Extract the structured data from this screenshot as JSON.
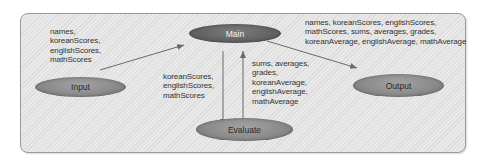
{
  "diagram": {
    "type": "data-flow",
    "nodes": {
      "main": "Main",
      "input": "Input",
      "evaluate": "Evaluate",
      "output": "Output"
    },
    "edges": {
      "input_to_main": {
        "from": "Input",
        "to": "Main",
        "lines": [
          "names,",
          "koreanScores,",
          "englishScores,",
          "mathScores"
        ]
      },
      "main_to_evaluate": {
        "from": "Main",
        "to": "Evaluate",
        "lines": [
          "koreanScores,",
          "englishScores,",
          "mathScores"
        ]
      },
      "evaluate_to_main": {
        "from": "Evaluate",
        "to": "Main",
        "lines": [
          "sums, averages,",
          "grades,",
          "koreanAverage,",
          "englishAverage,",
          "mathAverage"
        ]
      },
      "main_to_output": {
        "from": "Main",
        "to": "Output",
        "lines": [
          "names, koreanScores, englishScores,",
          "mathScores, sums, averages, grades,",
          "koreanAverage, englishAverage, mathAverage"
        ]
      }
    },
    "colors": {
      "panel_bg": "#e4e4e4",
      "panel_border": "#9a9a9a",
      "main_node": "#636363",
      "other_nodes": "#8b8b8b",
      "arrow": "#6a6a6a",
      "text": "#333333"
    }
  }
}
